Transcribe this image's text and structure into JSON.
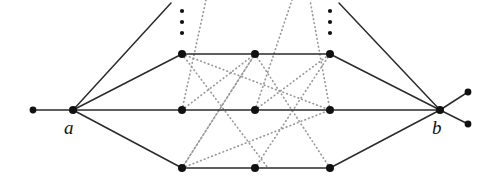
{
  "figure": {
    "kind": "graph-diagram",
    "width": 496,
    "height": 178,
    "background": "#ffffff",
    "solid_edge_color": "#2b2b2b",
    "dotted_edge_color": "#9a9a9a",
    "node_color": "#111111",
    "label_color": "#111111"
  },
  "labels": {
    "a": "a",
    "b": "b"
  },
  "label_positions": {
    "a": {
      "x": 64,
      "y": 118
    },
    "b": {
      "x": 432,
      "y": 118
    }
  },
  "hubs": [
    {
      "id": "a",
      "x": 73,
      "y": 110,
      "r": 4.0
    },
    {
      "id": "b",
      "x": 440,
      "y": 110,
      "r": 4.0
    }
  ],
  "pendants": [
    {
      "id": "p-left",
      "x": 33,
      "y": 110,
      "r": 3.4
    },
    {
      "id": "p-right-upper",
      "x": 468,
      "y": 92,
      "r": 3.4
    },
    {
      "id": "p-right-lower",
      "x": 468,
      "y": 124,
      "r": 3.4
    }
  ],
  "columns": [
    182,
    255,
    330
  ],
  "rows": [
    {
      "id": "row-top",
      "y": 54
    },
    {
      "id": "row-middle",
      "y": 110
    },
    {
      "id": "row-bottom",
      "y": 168
    }
  ],
  "nodes": [
    {
      "id": "n-top-1",
      "x": 182,
      "y": 54,
      "r": 4.0
    },
    {
      "id": "n-top-2",
      "x": 255,
      "y": 54,
      "r": 4.0
    },
    {
      "id": "n-top-3",
      "x": 330,
      "y": 54,
      "r": 4.0
    },
    {
      "id": "n-mid-1",
      "x": 182,
      "y": 110,
      "r": 4.0
    },
    {
      "id": "n-mid-2",
      "x": 255,
      "y": 110,
      "r": 4.0
    },
    {
      "id": "n-mid-3",
      "x": 330,
      "y": 110,
      "r": 4.0
    },
    {
      "id": "n-bot-1",
      "x": 182,
      "y": 168,
      "r": 4.0
    },
    {
      "id": "n-bot-2",
      "x": 255,
      "y": 168,
      "r": 4.0
    },
    {
      "id": "n-bot-3",
      "x": 330,
      "y": 168,
      "r": 4.0
    }
  ],
  "ellipsis_dots": [
    {
      "x": 182,
      "y": 11,
      "r": 2.1
    },
    {
      "x": 182,
      "y": 22,
      "r": 2.1
    },
    {
      "x": 182,
      "y": 33,
      "r": 2.1
    },
    {
      "x": 330,
      "y": 11,
      "r": 2.1
    },
    {
      "x": 330,
      "y": 22,
      "r": 2.1
    },
    {
      "x": 330,
      "y": 33,
      "r": 2.1
    }
  ],
  "solid_edges": [
    {
      "id": "e-pendant-left",
      "x1": 33,
      "y1": 110,
      "x2": 73,
      "y2": 110
    },
    {
      "id": "e-a-trail-up",
      "x1": 73,
      "y1": 110,
      "x2": 171,
      "y2": 3
    },
    {
      "id": "e-a-top1",
      "x1": 73,
      "y1": 110,
      "x2": 182,
      "y2": 54
    },
    {
      "id": "e-a-mid1",
      "x1": 73,
      "y1": 110,
      "x2": 182,
      "y2": 110
    },
    {
      "id": "e-a-bot1",
      "x1": 73,
      "y1": 110,
      "x2": 182,
      "y2": 168
    },
    {
      "id": "e-top-1-2",
      "x1": 182,
      "y1": 54,
      "x2": 255,
      "y2": 54
    },
    {
      "id": "e-top-2-3",
      "x1": 255,
      "y1": 54,
      "x2": 330,
      "y2": 54
    },
    {
      "id": "e-mid-1-2",
      "x1": 182,
      "y1": 110,
      "x2": 255,
      "y2": 110
    },
    {
      "id": "e-mid-2-3",
      "x1": 255,
      "y1": 110,
      "x2": 330,
      "y2": 110
    },
    {
      "id": "e-bot-1-2",
      "x1": 182,
      "y1": 168,
      "x2": 255,
      "y2": 168
    },
    {
      "id": "e-bot-2-3",
      "x1": 255,
      "y1": 168,
      "x2": 330,
      "y2": 168
    },
    {
      "id": "e-b-trail-up",
      "x1": 440,
      "y1": 110,
      "x2": 339,
      "y2": 3
    },
    {
      "id": "e-top3-b",
      "x1": 330,
      "y1": 54,
      "x2": 440,
      "y2": 110
    },
    {
      "id": "e-mid3-b",
      "x1": 330,
      "y1": 110,
      "x2": 440,
      "y2": 110
    },
    {
      "id": "e-bot3-b",
      "x1": 330,
      "y1": 168,
      "x2": 440,
      "y2": 110
    },
    {
      "id": "e-b-pendant-up",
      "x1": 440,
      "y1": 110,
      "x2": 468,
      "y2": 92
    },
    {
      "id": "e-b-pendant-down",
      "x1": 440,
      "y1": 110,
      "x2": 468,
      "y2": 124
    }
  ],
  "dotted_edges": [
    {
      "id": "d-1",
      "x1": 182,
      "y1": 54,
      "x2": 268,
      "y2": 168
    },
    {
      "id": "d-2",
      "x1": 182,
      "y1": 54,
      "x2": 330,
      "y2": 110
    },
    {
      "id": "d-3",
      "x1": 182,
      "y1": 110,
      "x2": 206,
      "y2": 0
    },
    {
      "id": "d-4",
      "x1": 182,
      "y1": 168,
      "x2": 255,
      "y2": 54
    },
    {
      "id": "d-5",
      "x1": 182,
      "y1": 168,
      "x2": 330,
      "y2": 110
    },
    {
      "id": "d-6",
      "x1": 255,
      "y1": 54,
      "x2": 182,
      "y2": 168
    },
    {
      "id": "d-7",
      "x1": 255,
      "y1": 110,
      "x2": 292,
      "y2": 0
    },
    {
      "id": "d-8",
      "x1": 255,
      "y1": 54,
      "x2": 330,
      "y2": 168
    },
    {
      "id": "d-9",
      "x1": 330,
      "y1": 54,
      "x2": 255,
      "y2": 168
    },
    {
      "id": "d-10",
      "x1": 330,
      "y1": 110,
      "x2": 310,
      "y2": 0
    },
    {
      "id": "d-11",
      "x1": 255,
      "y1": 110,
      "x2": 330,
      "y2": 54
    },
    {
      "id": "d-12",
      "x1": 182,
      "y1": 110,
      "x2": 255,
      "y2": 54
    }
  ]
}
